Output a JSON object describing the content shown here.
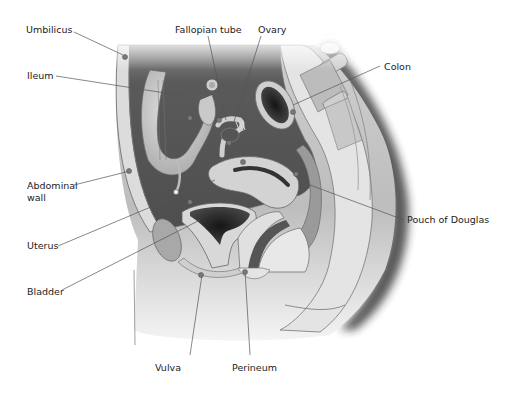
{
  "diagram": {
    "labels": {
      "umbilicus": "Umbilicus",
      "fallopian_tube": "Fallopian tube",
      "ovary": "Ovary",
      "colon": "Colon",
      "ileum": "Ileum",
      "abdominal_wall_1": "Abdominal",
      "abdominal_wall_2": "wall",
      "uterus": "Uterus",
      "pouch_of_douglas": "Pouch of Douglas",
      "bladder": "Bladder",
      "vulva": "Vulva",
      "perineum": "Perineum"
    },
    "colors": {
      "body_light": "#e6e6e6",
      "body_mid": "#b8b8b8",
      "cavity_dark": "#5e5e5e",
      "organ_light": "#d2d2d2",
      "organ_dark": "#2e2e2e",
      "leader_line": "#555555",
      "marker_dot": "#7a7a7a"
    }
  }
}
